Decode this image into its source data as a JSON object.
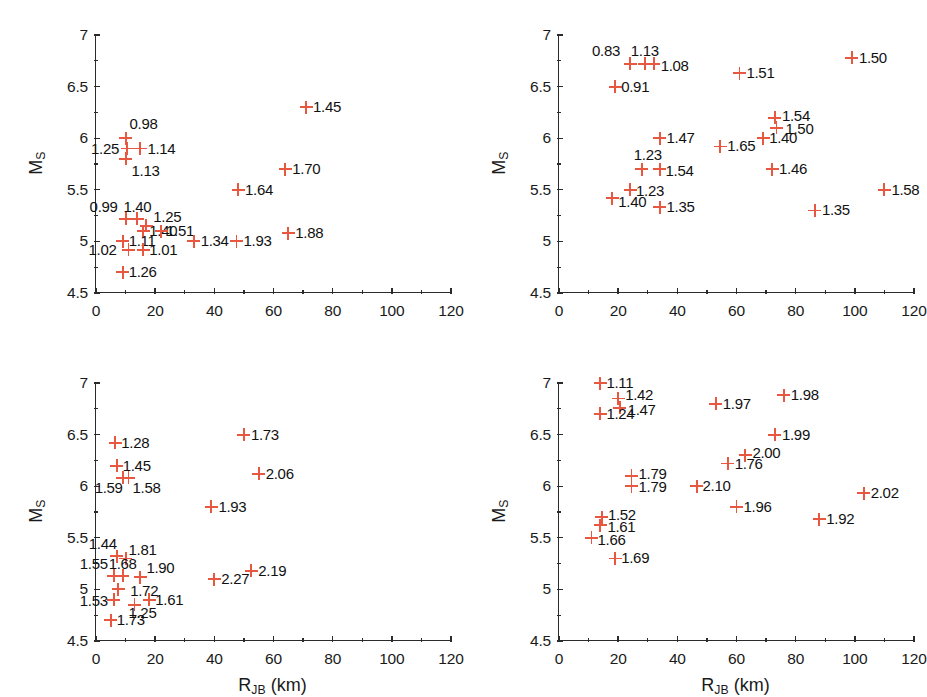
{
  "figure": {
    "width": 926,
    "height": 697,
    "marker_color": "#e8573f",
    "axis_color": "#2b2b2b",
    "background": "#ffffff"
  },
  "axes": {
    "xlabel_main": "R",
    "xlabel_sub": "JB",
    "xlabel_unit": " (km)",
    "ylabel_main": "M",
    "ylabel_sub": "S",
    "xlim": [
      0,
      120
    ],
    "ylim": [
      4.5,
      7
    ],
    "xticks": [
      0,
      20,
      40,
      60,
      80,
      100,
      120
    ],
    "xticklabels": [
      "0",
      "20",
      "40",
      "60",
      "80",
      "100",
      "120"
    ],
    "xminorticks": [
      10,
      30,
      50,
      70,
      90,
      110
    ],
    "yticks": [
      4.5,
      5,
      5.5,
      6,
      6.5,
      7
    ],
    "yticklabels": [
      "4.5",
      "5",
      "5.5",
      "6",
      "6.5",
      "7"
    ],
    "yminorticks": [
      4.75,
      5.25,
      5.75,
      6.25,
      6.75
    ],
    "grid": false
  },
  "chart_data": [
    {
      "type": "scatter",
      "panel": "top-left",
      "title": "",
      "xlabel": "R_JB (km)",
      "ylabel": "M_S",
      "xlim": [
        0,
        120
      ],
      "ylim": [
        4.5,
        7
      ],
      "marker": "+",
      "color": "#e8573f",
      "points": [
        {
          "x": 71.0,
          "y": 6.3,
          "label": "1.45",
          "lx": 7,
          "ly": -8
        },
        {
          "x": 10.0,
          "y": 6.0,
          "label": "0.98",
          "lx": 4,
          "ly": -22
        },
        {
          "x": 15.0,
          "y": 5.9,
          "label": "1.14",
          "lx": 7,
          "ly": -8
        },
        {
          "x": 10.5,
          "y": 5.9,
          "label": "1.25",
          "lx": -36,
          "ly": -8
        },
        {
          "x": 10.0,
          "y": 5.8,
          "label": "1.13",
          "lx": 6,
          "ly": 4
        },
        {
          "x": 64.0,
          "y": 5.7,
          "label": "1.70",
          "lx": 7,
          "ly": -8
        },
        {
          "x": 48.0,
          "y": 5.5,
          "label": "1.64",
          "lx": 7,
          "ly": -8
        },
        {
          "x": 10.0,
          "y": 5.22,
          "label": "0.99",
          "lx": -36,
          "ly": -20
        },
        {
          "x": 14.0,
          "y": 5.22,
          "label": "1.40",
          "lx": -14,
          "ly": -20
        },
        {
          "x": 17.0,
          "y": 5.15,
          "label": "1.25",
          "lx": 7,
          "ly": -17
        },
        {
          "x": 16.0,
          "y": 5.1,
          "label": "1.40",
          "lx": 6,
          "ly": -8
        },
        {
          "x": 22.0,
          "y": 5.1,
          "label": "1.51",
          "lx": 5,
          "ly": -8
        },
        {
          "x": 9.0,
          "y": 5.0,
          "label": "1.11",
          "lx": 6,
          "ly": -8
        },
        {
          "x": 33.0,
          "y": 5.0,
          "label": "1.34",
          "lx": 7,
          "ly": -8
        },
        {
          "x": 47.5,
          "y": 5.0,
          "label": "1.93",
          "lx": 7,
          "ly": -8
        },
        {
          "x": 65.0,
          "y": 5.08,
          "label": "1.88",
          "lx": 7,
          "ly": -8
        },
        {
          "x": 16.0,
          "y": 4.92,
          "label": "1.01",
          "lx": 6,
          "ly": -8
        },
        {
          "x": 11.0,
          "y": 4.92,
          "label": "1.02",
          "lx": -40,
          "ly": -8
        },
        {
          "x": 9.0,
          "y": 4.7,
          "label": "1.26",
          "lx": 6,
          "ly": -8
        }
      ]
    },
    {
      "type": "scatter",
      "panel": "top-right",
      "title": "",
      "xlabel": "R_JB (km)",
      "ylabel": "M_S",
      "xlim": [
        0,
        120
      ],
      "ylim": [
        4.5,
        7
      ],
      "marker": "+",
      "color": "#e8573f",
      "points": [
        {
          "x": 99.0,
          "y": 6.78,
          "label": "1.50",
          "lx": 7,
          "ly": -8
        },
        {
          "x": 24.0,
          "y": 6.72,
          "label": "0.83",
          "lx": -38,
          "ly": -21
        },
        {
          "x": 29.0,
          "y": 6.72,
          "label": "1.13",
          "lx": -14,
          "ly": -21
        },
        {
          "x": 32.0,
          "y": 6.72,
          "label": "1.08",
          "lx": 7,
          "ly": -6
        },
        {
          "x": 61.0,
          "y": 6.63,
          "label": "1.51",
          "lx": 7,
          "ly": -8
        },
        {
          "x": 19.0,
          "y": 6.5,
          "label": "0.91",
          "lx": 6,
          "ly": -8
        },
        {
          "x": 73.0,
          "y": 6.2,
          "label": "1.54",
          "lx": 7,
          "ly": -10
        },
        {
          "x": 73.5,
          "y": 6.1,
          "label": "1.50",
          "lx": 9,
          "ly": -7
        },
        {
          "x": 34.0,
          "y": 6.0,
          "label": "1.47",
          "lx": 7,
          "ly": -8
        },
        {
          "x": 69.0,
          "y": 6.0,
          "label": "1.40",
          "lx": 6,
          "ly": -8
        },
        {
          "x": 54.5,
          "y": 5.92,
          "label": "1.65",
          "lx": 7,
          "ly": -8
        },
        {
          "x": 28.0,
          "y": 5.7,
          "label": "1.23",
          "lx": -8,
          "ly": -22
        },
        {
          "x": 34.0,
          "y": 5.7,
          "label": "1.54",
          "lx": 6,
          "ly": -6
        },
        {
          "x": 72.0,
          "y": 5.7,
          "label": "1.46",
          "lx": 7,
          "ly": -8
        },
        {
          "x": 24.0,
          "y": 5.5,
          "label": "1.23",
          "lx": 6,
          "ly": -7
        },
        {
          "x": 110.0,
          "y": 5.5,
          "label": "1.58",
          "lx": 7,
          "ly": -8
        },
        {
          "x": 18.0,
          "y": 5.42,
          "label": "1.40",
          "lx": 6,
          "ly": -4
        },
        {
          "x": 34.0,
          "y": 5.33,
          "label": "1.35",
          "lx": 7,
          "ly": -8
        },
        {
          "x": 86.5,
          "y": 5.3,
          "label": "1.35",
          "lx": 7,
          "ly": -8
        }
      ]
    },
    {
      "type": "scatter",
      "panel": "bottom-left",
      "title": "",
      "xlabel": "R_JB (km)",
      "ylabel": "M_S",
      "xlim": [
        0,
        120
      ],
      "ylim": [
        4.5,
        7
      ],
      "marker": "+",
      "color": "#e8573f",
      "points": [
        {
          "x": 50.0,
          "y": 6.5,
          "label": "1.73",
          "lx": 7,
          "ly": -8
        },
        {
          "x": 6.5,
          "y": 6.42,
          "label": "1.28",
          "lx": 6,
          "ly": -8
        },
        {
          "x": 7.0,
          "y": 6.2,
          "label": "1.45",
          "lx": 6,
          "ly": -8
        },
        {
          "x": 55.0,
          "y": 6.12,
          "label": "2.06",
          "lx": 7,
          "ly": -8
        },
        {
          "x": 11.0,
          "y": 6.08,
          "label": "1.58",
          "lx": 4,
          "ly": 2
        },
        {
          "x": 9.0,
          "y": 6.08,
          "label": "1.59",
          "lx": -28,
          "ly": 2
        },
        {
          "x": 39.0,
          "y": 5.8,
          "label": "1.93",
          "lx": 7,
          "ly": -8
        },
        {
          "x": 7.0,
          "y": 5.32,
          "label": "1.44",
          "lx": -28,
          "ly": -20
        },
        {
          "x": 10.0,
          "y": 5.3,
          "label": "1.81",
          "lx": 3,
          "ly": -16
        },
        {
          "x": 6.0,
          "y": 5.13,
          "label": "1.55",
          "lx": -34,
          "ly": -20
        },
        {
          "x": 9.0,
          "y": 5.13,
          "label": "1.68",
          "lx": -14,
          "ly": -20
        },
        {
          "x": 15.0,
          "y": 5.12,
          "label": "1.90",
          "lx": 6,
          "ly": -17
        },
        {
          "x": 52.5,
          "y": 5.18,
          "label": "2.19",
          "lx": 7,
          "ly": -8
        },
        {
          "x": 40.0,
          "y": 5.1,
          "label": "2.27",
          "lx": 7,
          "ly": -8
        },
        {
          "x": 7.5,
          "y": 5.0,
          "label": "1.72",
          "lx": 12,
          "ly": -6
        },
        {
          "x": 6.0,
          "y": 4.9,
          "label": "1.53",
          "lx": -34,
          "ly": -7
        },
        {
          "x": 18.0,
          "y": 4.9,
          "label": "1.61",
          "lx": 6,
          "ly": -8
        },
        {
          "x": 13.0,
          "y": 4.85,
          "label": "1.25",
          "lx": -6,
          "ly": 0
        },
        {
          "x": 5.0,
          "y": 4.7,
          "label": "1.73",
          "lx": 6,
          "ly": -8
        }
      ]
    },
    {
      "type": "scatter",
      "panel": "bottom-right",
      "title": "",
      "xlabel": "R_JB (km)",
      "ylabel": "M_S",
      "xlim": [
        0,
        120
      ],
      "ylim": [
        4.5,
        7
      ],
      "marker": "+",
      "color": "#e8573f",
      "points": [
        {
          "x": 14.0,
          "y": 7.0,
          "label": "1.11",
          "lx": 6,
          "ly": -8
        },
        {
          "x": 76.0,
          "y": 6.88,
          "label": "1.98",
          "lx": 7,
          "ly": -8
        },
        {
          "x": 20.0,
          "y": 6.85,
          "label": "1.42",
          "lx": 7,
          "ly": -11
        },
        {
          "x": 53.0,
          "y": 6.8,
          "label": "1.97",
          "lx": 7,
          "ly": -8
        },
        {
          "x": 20.5,
          "y": 6.76,
          "label": "1.47",
          "lx": 8,
          "ly": -6
        },
        {
          "x": 14.0,
          "y": 6.7,
          "label": "1.24",
          "lx": 6,
          "ly": -8
        },
        {
          "x": 73.0,
          "y": 6.5,
          "label": "1.99",
          "lx": 7,
          "ly": -8
        },
        {
          "x": 63.0,
          "y": 6.3,
          "label": "2.00",
          "lx": 7,
          "ly": -10
        },
        {
          "x": 57.0,
          "y": 6.22,
          "label": "1.76",
          "lx": 7,
          "ly": -7
        },
        {
          "x": 24.5,
          "y": 6.1,
          "label": "1.79",
          "lx": 7,
          "ly": -10
        },
        {
          "x": 24.5,
          "y": 6.0,
          "label": "1.79",
          "lx": 7,
          "ly": -7
        },
        {
          "x": 46.5,
          "y": 6.0,
          "label": "2.10",
          "lx": 6,
          "ly": -8
        },
        {
          "x": 103.0,
          "y": 5.93,
          "label": "2.02",
          "lx": 7,
          "ly": -8
        },
        {
          "x": 60.0,
          "y": 5.8,
          "label": "1.96",
          "lx": 7,
          "ly": -8
        },
        {
          "x": 14.5,
          "y": 5.7,
          "label": "1.52",
          "lx": 6,
          "ly": -10
        },
        {
          "x": 88.0,
          "y": 5.68,
          "label": "1.92",
          "lx": 7,
          "ly": -8
        },
        {
          "x": 14.0,
          "y": 5.62,
          "label": "1.61",
          "lx": 7,
          "ly": -6
        },
        {
          "x": 11.0,
          "y": 5.5,
          "label": "1.66",
          "lx": 6,
          "ly": -6
        },
        {
          "x": 19.0,
          "y": 5.3,
          "label": "1.69",
          "lx": 6,
          "ly": -8
        }
      ]
    }
  ]
}
